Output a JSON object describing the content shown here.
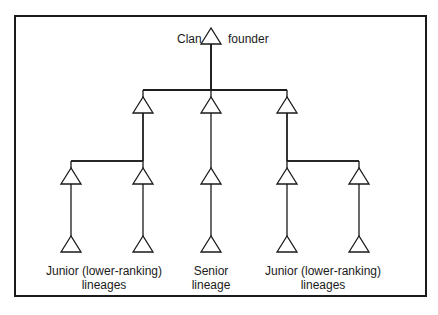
{
  "diagram": {
    "title_left": "Clan",
    "title_right": "founder",
    "labels": {
      "junior_left": [
        "Junior (lower-ranking)",
        "lineages"
      ],
      "senior": [
        "Senior",
        "lineage"
      ],
      "junior_right": [
        "Junior (lower-ranking)",
        "lineages"
      ]
    },
    "nodes": [
      {
        "id": "founder",
        "level": 0,
        "parent": null
      },
      {
        "id": "gen1-left",
        "level": 1,
        "parent": "founder"
      },
      {
        "id": "gen1-center",
        "level": 1,
        "parent": "founder"
      },
      {
        "id": "gen1-right",
        "level": 1,
        "parent": "founder"
      },
      {
        "id": "gen2-a",
        "level": 2,
        "parent": "gen1-left"
      },
      {
        "id": "gen2-b",
        "level": 2,
        "parent": "gen1-left"
      },
      {
        "id": "gen2-c",
        "level": 2,
        "parent": "gen1-center"
      },
      {
        "id": "gen2-d",
        "level": 2,
        "parent": "gen1-right"
      },
      {
        "id": "gen2-e",
        "level": 2,
        "parent": "gen1-right"
      },
      {
        "id": "gen3-a",
        "level": 3,
        "parent": "gen2-a"
      },
      {
        "id": "gen3-b",
        "level": 3,
        "parent": "gen2-b"
      },
      {
        "id": "gen3-c",
        "level": 3,
        "parent": "gen2-c"
      },
      {
        "id": "gen3-d",
        "level": 3,
        "parent": "gen2-d"
      },
      {
        "id": "gen3-e",
        "level": 3,
        "parent": "gen2-e"
      }
    ]
  }
}
